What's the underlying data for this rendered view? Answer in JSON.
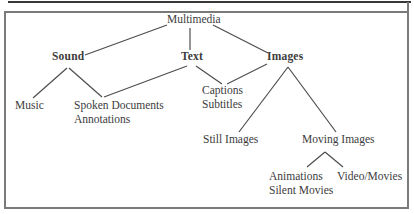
{
  "figure": {
    "type": "tree-diagram",
    "root": "Multimedia",
    "colors": {
      "ink": "#3c3c3c",
      "line": "#4d4d4d",
      "frame": "#7a7a7a",
      "rule": "#383838",
      "background": "#ffffff"
    }
  },
  "nodes": {
    "multimedia": {
      "label": "Multimedia",
      "emphasis": "normal"
    },
    "sound": {
      "label": "Sound",
      "emphasis": "bold"
    },
    "text": {
      "label": "Text",
      "emphasis": "bold"
    },
    "images": {
      "label": "Images",
      "emphasis": "bold"
    },
    "music": {
      "label": "Music",
      "emphasis": "normal"
    },
    "spoken_documents": {
      "line1": "Spoken Documents",
      "line2": "Annotations",
      "emphasis": "normal"
    },
    "captions": {
      "line1": "Captions",
      "line2": "Subtitles",
      "emphasis": "normal"
    },
    "still_images": {
      "label": "Still Images",
      "emphasis": "normal"
    },
    "moving_images": {
      "label": "Moving Images",
      "emphasis": "normal"
    },
    "animations": {
      "line1": "Animations",
      "line2": "Silent Movies",
      "emphasis": "normal"
    },
    "video_movies": {
      "label": "Video/Movies",
      "emphasis": "normal"
    }
  },
  "relations": [
    {
      "parent": "Multimedia",
      "children": [
        "Sound",
        "Text",
        "Images"
      ]
    },
    {
      "parent": "Sound",
      "children": [
        "Music",
        "Spoken Documents / Annotations"
      ]
    },
    {
      "parent": "Text",
      "children": [
        "Spoken Documents / Annotations",
        "Captions / Subtitles"
      ]
    },
    {
      "parent": "Images",
      "children": [
        "Captions / Subtitles",
        "Still Images",
        "Moving Images"
      ]
    },
    {
      "parent": "Moving Images",
      "children": [
        "Animations / Silent Movies",
        "Video/Movies"
      ]
    }
  ]
}
